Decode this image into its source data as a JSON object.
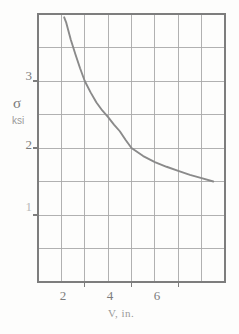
{
  "chart_data": {
    "type": "line",
    "title": "",
    "xlabel": "V, in.",
    "ylabel": "σ",
    "ylabel_units": "ksi",
    "xlim": [
      0,
      8
    ],
    "ylim": [
      0,
      4
    ],
    "grid": true,
    "legend": null,
    "x_major_ticks": [
      2,
      4,
      6
    ],
    "x_major_tick_labels": [
      "2",
      "4",
      "6"
    ],
    "x_gridlines": [
      1,
      2,
      3,
      4,
      5,
      6,
      7
    ],
    "y_major_ticks": [
      1,
      2,
      3
    ],
    "y_major_tick_labels": [
      "1",
      "2",
      "3"
    ],
    "y_gridlines": [
      0.5,
      1.0,
      1.5,
      2.0,
      2.5,
      3.0,
      3.5
    ],
    "curve_color": "#8a8a8a",
    "grid_color": "#a9a9a9",
    "axis_color": "#7d7d7d",
    "series": [
      {
        "name": "sigma-vs-V",
        "relation": "sigma * V = 9 (approx. hyperbola)",
        "x": [
          1.12,
          1.2,
          1.4,
          1.6,
          1.8,
          2.0,
          2.25,
          2.5,
          2.75,
          3.0,
          3.25,
          3.5,
          3.75,
          4.0,
          4.5,
          5.0,
          5.5,
          6.0,
          6.5,
          7.0,
          7.5
        ],
        "y": [
          3.95,
          3.88,
          3.62,
          3.4,
          3.19,
          3.0,
          2.83,
          2.68,
          2.56,
          2.46,
          2.35,
          2.25,
          2.12,
          2.0,
          1.88,
          1.79,
          1.72,
          1.66,
          1.6,
          1.55,
          1.5
        ]
      }
    ]
  },
  "axes": {
    "y_axis_symbol": "σ",
    "y_axis_units": "ksi",
    "x_axis_caption": "V, in.",
    "ytick_3": "3",
    "ytick_2": "2",
    "ytick_1": "1",
    "xtick_2": "2",
    "xtick_4": "4",
    "xtick_6": "6"
  }
}
